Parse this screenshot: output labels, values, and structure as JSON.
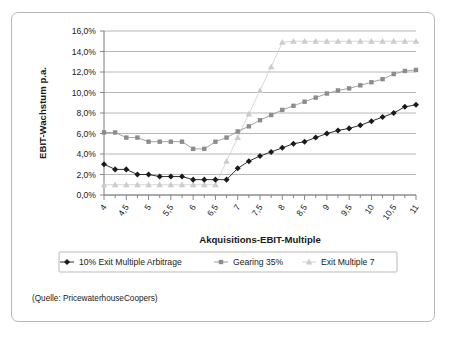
{
  "source_note": "(Quelle: PricewaterhouseCoopers)",
  "axis": {
    "ylabel": "EBIT-Wachstum p.a.",
    "xlabel": "Akquisitions-EBIT-Multiple",
    "ytick_labels": [
      "0,0%",
      "2,0%",
      "4,0%",
      "6,0%",
      "8,0%",
      "10,0%",
      "12,0%",
      "14,0%",
      "16,0%"
    ],
    "xtick_labels": [
      "4",
      "4,5",
      "5",
      "5,5",
      "6",
      "6,5",
      "7",
      "7,5",
      "8",
      "8,5",
      "9",
      "9,5",
      "10",
      "10,5",
      "11"
    ]
  },
  "legend": {
    "items": [
      {
        "label": "10% Exit Multiple Arbitrage",
        "marker": "diamond",
        "color": "#1a1a1a"
      },
      {
        "label": "Gearing 35%",
        "marker": "square",
        "color": "#8c8c8c"
      },
      {
        "label": "Exit Multiple 7",
        "marker": "triangle",
        "color": "#cccccc"
      }
    ]
  },
  "chart_data": {
    "type": "line",
    "title": "",
    "xlabel": "Akquisitions-EBIT-Multiple",
    "ylabel": "EBIT-Wachstum p.a.",
    "xlim": [
      4,
      11
    ],
    "ylim": [
      0,
      16
    ],
    "grid": true,
    "legend_position": "bottom",
    "x": [
      4,
      4.25,
      4.5,
      4.75,
      5,
      5.25,
      5.5,
      5.75,
      6,
      6.25,
      6.5,
      6.75,
      7,
      7.25,
      7.5,
      7.75,
      8,
      8.25,
      8.5,
      8.75,
      9,
      9.25,
      9.5,
      9.75,
      10,
      10.25,
      10.5,
      10.75,
      11
    ],
    "series": [
      {
        "name": "10% Exit Multiple Arbitrage",
        "marker": "diamond",
        "color": "#1a1a1a",
        "values": [
          3.0,
          2.5,
          2.5,
          2.0,
          2.0,
          1.8,
          1.8,
          1.8,
          1.5,
          1.5,
          1.5,
          1.5,
          2.6,
          3.3,
          3.8,
          4.2,
          4.6,
          5.0,
          5.2,
          5.6,
          6.0,
          6.3,
          6.5,
          6.8,
          7.2,
          7.6,
          8.0,
          8.6,
          8.8
        ]
      },
      {
        "name": "Gearing 35%",
        "marker": "square",
        "color": "#8c8c8c",
        "values": [
          6.1,
          6.1,
          5.6,
          5.6,
          5.2,
          5.2,
          5.2,
          5.2,
          4.5,
          4.5,
          5.2,
          5.6,
          6.2,
          6.7,
          7.3,
          7.8,
          8.3,
          8.7,
          9.1,
          9.5,
          9.9,
          10.2,
          10.4,
          10.7,
          11.0,
          11.3,
          11.8,
          12.1,
          12.2
        ]
      },
      {
        "name": "Exit Multiple 7",
        "marker": "triangle",
        "color": "#cccccc",
        "values": [
          1.0,
          1.0,
          1.0,
          1.0,
          1.0,
          1.0,
          1.0,
          1.0,
          1.0,
          1.0,
          1.0,
          3.3,
          5.6,
          7.9,
          10.2,
          12.5,
          14.9,
          15.0,
          15.0,
          15.0,
          15.0,
          15.0,
          15.0,
          15.0,
          15.0,
          15.0,
          15.0,
          15.0,
          15.0
        ]
      }
    ]
  }
}
